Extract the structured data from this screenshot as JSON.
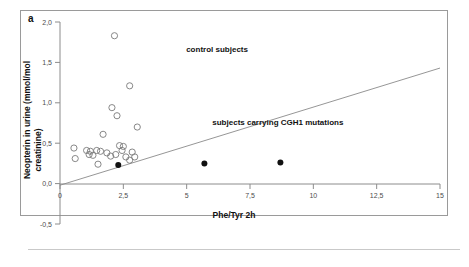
{
  "figure": {
    "panel_label": "a"
  },
  "chart_data": {
    "type": "scatter",
    "title": "",
    "xlabel": "Phe/Tyr 2h",
    "ylabel": "Neopterin in urine (mmol/mol creatinine)",
    "xlim": [
      0,
      15
    ],
    "ylim": [
      -0.5,
      2.0
    ],
    "xticks": [
      0,
      2.5,
      5,
      7.5,
      10,
      12.5,
      15
    ],
    "xticklabels": [
      "0",
      "2,5",
      "5",
      "7,5",
      "10",
      "12,5",
      "15"
    ],
    "yticks": [
      -0.5,
      0.0,
      0.5,
      1.0,
      1.5,
      2.0
    ],
    "yticklabels": [
      "-0,5",
      "0,0",
      "0,5",
      "1,0",
      "1,5",
      "2,0"
    ],
    "grid": false,
    "legend_position": "in-plot-annotations",
    "annotations": [
      {
        "text": "control subjects",
        "x": 6.2,
        "y": 1.63
      },
      {
        "text": "subjects carrying CGH1 mutations",
        "x": 8.6,
        "y": 0.72
      }
    ],
    "reference_line": {
      "label": "regression line",
      "x0": 0.0,
      "y0": -0.02,
      "x1": 15.0,
      "y1": 1.43
    },
    "series": [
      {
        "name": "control subjects",
        "marker": "open-circle",
        "color": "#7a7a7a",
        "points": [
          [
            2.15,
            1.83
          ],
          [
            2.75,
            1.21
          ],
          [
            2.05,
            0.94
          ],
          [
            2.25,
            0.84
          ],
          [
            3.05,
            0.7
          ],
          [
            1.7,
            0.61
          ],
          [
            0.55,
            0.44
          ],
          [
            1.05,
            0.41
          ],
          [
            1.2,
            0.4
          ],
          [
            1.45,
            0.41
          ],
          [
            1.6,
            0.4
          ],
          [
            2.35,
            0.47
          ],
          [
            2.5,
            0.46
          ],
          [
            2.45,
            0.41
          ],
          [
            2.2,
            0.36
          ],
          [
            2.85,
            0.39
          ],
          [
            0.6,
            0.31
          ],
          [
            1.15,
            0.36
          ],
          [
            1.3,
            0.35
          ],
          [
            2.0,
            0.34
          ],
          [
            2.6,
            0.33
          ],
          [
            2.95,
            0.33
          ],
          [
            1.5,
            0.24
          ],
          [
            2.75,
            0.29
          ],
          [
            1.85,
            0.38
          ]
        ]
      },
      {
        "name": "subjects carrying CGH1 mutations",
        "marker": "filled-circle",
        "color": "#111111",
        "points": [
          [
            2.3,
            0.23
          ],
          [
            5.7,
            0.25
          ],
          [
            8.7,
            0.26
          ]
        ]
      }
    ]
  }
}
